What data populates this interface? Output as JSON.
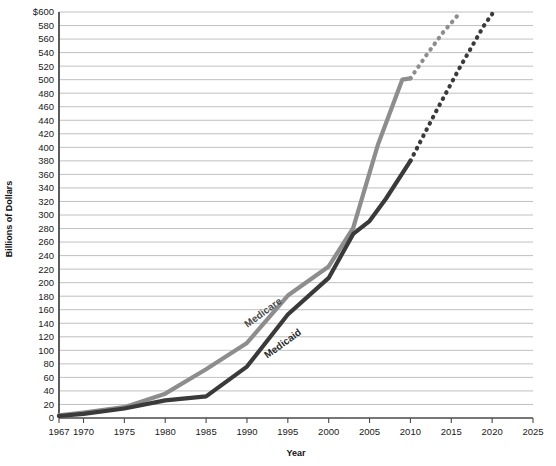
{
  "chart_data": {
    "type": "line",
    "title": "",
    "xlabel": "Year",
    "ylabel": "Billions of Dollars",
    "xlim": [
      1967,
      2025
    ],
    "ylim": [
      0,
      600
    ],
    "grid": true,
    "legend_position": "inline-labels",
    "x_ticks": [
      1967,
      1970,
      1975,
      1980,
      1985,
      1990,
      1995,
      2000,
      2005,
      2010,
      2015,
      2020,
      2025
    ],
    "x_tick_labels": [
      "1967",
      "1970",
      "1975",
      "1980",
      "1985",
      "1990",
      "1995",
      "2000",
      "2005",
      "2010",
      "2015",
      "2020",
      "2025"
    ],
    "y_ticks": [
      0,
      20,
      40,
      60,
      80,
      100,
      120,
      140,
      160,
      180,
      200,
      220,
      240,
      260,
      280,
      300,
      320,
      340,
      360,
      380,
      400,
      420,
      440,
      460,
      480,
      500,
      520,
      540,
      560,
      580,
      600
    ],
    "y_tick_labels": [
      "0",
      "20",
      "40",
      "60",
      "80",
      "100",
      "120",
      "140",
      "160",
      "180",
      "200",
      "220",
      "240",
      "260",
      "280",
      "300",
      "320",
      "340",
      "360",
      "380",
      "400",
      "420",
      "440",
      "460",
      "480",
      "500",
      "520",
      "540",
      "560",
      "580",
      "$600"
    ],
    "series": [
      {
        "name": "Medicare",
        "color": "#8d8d8d",
        "label_text": "Medicare",
        "label_color": "#4a4a4a",
        "solid": {
          "x": [
            1967,
            1970,
            1975,
            1980,
            1985,
            1990,
            1995,
            2000,
            2003,
            2006,
            2009,
            2010
          ],
          "y": [
            4,
            8,
            16,
            36,
            72,
            111,
            181,
            224,
            281,
            403,
            500,
            502
          ]
        },
        "projected": {
          "x": [
            2010,
            2012,
            2014,
            2016
          ],
          "y": [
            502,
            537,
            570,
            598
          ]
        }
      },
      {
        "name": "Medicaid",
        "color": "#3a3a3a",
        "label_text": "Medicaid",
        "label_color": "#2a2a2a",
        "solid": {
          "x": [
            1967,
            1970,
            1975,
            1980,
            1985,
            1990,
            1995,
            2000,
            2003,
            2005,
            2007,
            2010
          ],
          "y": [
            3,
            6,
            14,
            26,
            32,
            76,
            153,
            207,
            272,
            291,
            324,
            380
          ]
        },
        "projected": {
          "x": [
            2010,
            2013,
            2016,
            2019,
            2020
          ],
          "y": [
            380,
            450,
            517,
            580,
            597
          ]
        }
      }
    ]
  }
}
